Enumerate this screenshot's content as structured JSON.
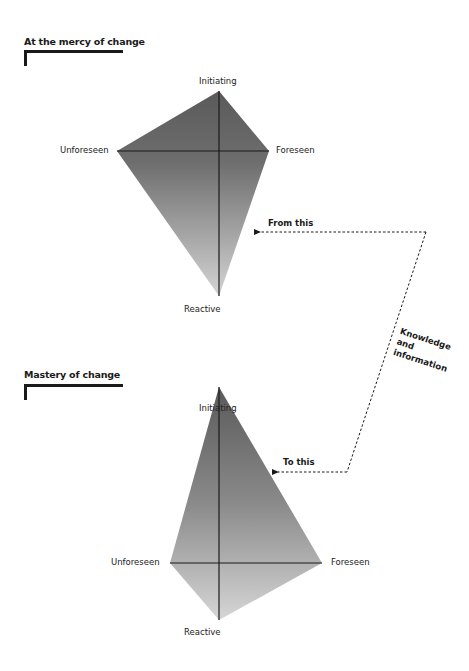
{
  "top_section": {
    "title": "At the mercy of change",
    "labels": {
      "top": "Initiating",
      "left": "Unforeseen",
      "right": "Foreseen",
      "bottom": "Reactive"
    }
  },
  "bottom_section": {
    "title": "Mastery of change",
    "labels": {
      "top": "Initiating",
      "left": "Unforeseen",
      "right": "Foreseen",
      "bottom": "Reactive"
    }
  },
  "connector": {
    "from_label": "From this",
    "to_label": "To this",
    "middle_label_lines": [
      "Knowledge",
      "and",
      "information"
    ]
  },
  "colors": {
    "shape_dark": "#5f5f5f",
    "shape_light": "#cfcfcf",
    "line": "#1a1a1a"
  }
}
